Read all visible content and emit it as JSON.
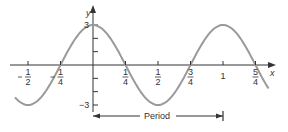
{
  "chart_data": {
    "type": "line",
    "title": "",
    "function": "y = 3cos(2πx)",
    "xlabel": "x",
    "ylabel": "y",
    "xlim": [
      -0.6,
      1.35
    ],
    "ylim": [
      -3,
      3
    ],
    "x_ticks": [
      {
        "value": -0.5,
        "num": "1",
        "den": "2",
        "neg": true
      },
      {
        "value": -0.25,
        "num": "1",
        "den": "4",
        "neg": true
      },
      {
        "value": 0.25,
        "num": "1",
        "den": "4",
        "neg": false
      },
      {
        "value": 0.5,
        "num": "1",
        "den": "2",
        "neg": false
      },
      {
        "value": 0.75,
        "num": "3",
        "den": "4",
        "neg": false
      },
      {
        "value": 1,
        "num": "1",
        "den": "",
        "neg": false
      },
      {
        "value": 1.25,
        "num": "5",
        "den": "4",
        "neg": false
      }
    ],
    "y_tick_labels": {
      "max": "3",
      "min": "−3"
    },
    "series": [
      {
        "name": "y = 3cos(2πx)",
        "amplitude": 3,
        "period": 1
      }
    ],
    "annotation": {
      "label": "Period",
      "from": 0,
      "to": 1
    },
    "colors": {
      "curve": "#9a9a9a",
      "axis": "#333333"
    }
  }
}
